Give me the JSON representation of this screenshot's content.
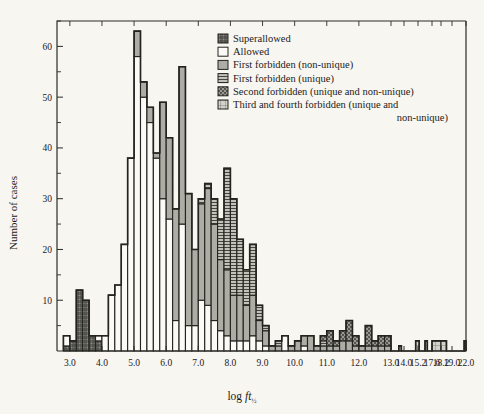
{
  "figure": {
    "background_color": "#f8f6f1",
    "frame_color": "#23231f"
  },
  "legend": {
    "position": "top-right-inside",
    "items": [
      {
        "label": "Superallowed",
        "pattern": "cross-hatch-dark",
        "color": "#6f6f68"
      },
      {
        "label": "Allowed",
        "pattern": "empty",
        "color": "#ffffff"
      },
      {
        "label": "First forbidden (non-unique)",
        "pattern": "solid-gray",
        "color": "#a9a9a2"
      },
      {
        "label": "First forbidden (unique)",
        "pattern": "horizontal-lines",
        "color": "#b6b6ae"
      },
      {
        "label": "Second forbidden (unique and non-unique)",
        "pattern": "checker-dark",
        "color": "#8a8a82"
      },
      {
        "label": "Third and fourth forbidden (unique and",
        "pattern": "light-grid",
        "color": "#cfcfc7"
      },
      {
        "label": "non-unique)",
        "pattern": "continuation",
        "color": ""
      }
    ]
  },
  "chart_data": {
    "type": "bar",
    "subtype": "stacked-histogram",
    "title": "",
    "xlabel": "log ft½",
    "ylabel": "Number of cases",
    "xlim": [
      2.6,
      22.6
    ],
    "ylim": [
      0,
      65
    ],
    "grid": false,
    "bin_width": 0.2,
    "y_ticks_major": [
      10,
      20,
      30,
      40,
      50,
      60
    ],
    "y_ticks_minor": [
      5,
      15,
      25,
      35,
      45,
      55,
      65
    ],
    "x_tick_labels": [
      "3.0",
      "4.0",
      "5.0",
      "6.0",
      "7.0",
      "8.0",
      "9.0",
      "10.0",
      "11.0",
      "12.0",
      "13.0",
      "14.0",
      "15.2",
      "17.6",
      "18.2",
      "19.0",
      "22.0"
    ],
    "x_tick_values": [
      3.0,
      4.0,
      5.0,
      6.0,
      7.0,
      8.0,
      9.0,
      10.0,
      11.0,
      12.0,
      13.0,
      14.0,
      15.2,
      17.6,
      18.2,
      19.0,
      22.0
    ],
    "x_axis_note": "linear from 3.0 to 13.0, compressed beyond 13.0",
    "series": [
      {
        "name": "Superallowed",
        "pattern": "cross-hatch-dark"
      },
      {
        "name": "Allowed",
        "pattern": "empty"
      },
      {
        "name": "First forbidden (non-unique)",
        "pattern": "solid-gray"
      },
      {
        "name": "First forbidden (unique)",
        "pattern": "horizontal-lines"
      },
      {
        "name": "Second forbidden (unique and non-unique)",
        "pattern": "checker-dark"
      },
      {
        "name": "Third and fourth forbidden (unique and non-unique)",
        "pattern": "light-grid"
      }
    ],
    "bins": [
      {
        "x0": 2.8,
        "x1": 3.0,
        "superallowed": 1,
        "allowed": 2,
        "ff_nonunique": 0,
        "ff_unique": 0,
        "second": 0,
        "third_fourth": 0
      },
      {
        "x0": 3.0,
        "x1": 3.2,
        "superallowed": 2,
        "allowed": 0,
        "ff_nonunique": 0,
        "ff_unique": 0,
        "second": 0,
        "third_fourth": 0
      },
      {
        "x0": 3.2,
        "x1": 3.4,
        "superallowed": 12,
        "allowed": 0,
        "ff_nonunique": 0,
        "ff_unique": 0,
        "second": 0,
        "third_fourth": 0
      },
      {
        "x0": 3.4,
        "x1": 3.6,
        "superallowed": 10,
        "allowed": 0,
        "ff_nonunique": 0,
        "ff_unique": 0,
        "second": 0,
        "third_fourth": 0
      },
      {
        "x0": 3.6,
        "x1": 3.8,
        "superallowed": 3,
        "allowed": 0,
        "ff_nonunique": 0,
        "ff_unique": 0,
        "second": 0,
        "third_fourth": 0
      },
      {
        "x0": 3.8,
        "x1": 4.0,
        "superallowed": 2,
        "allowed": 1,
        "ff_nonunique": 0,
        "ff_unique": 0,
        "second": 0,
        "third_fourth": 0
      },
      {
        "x0": 4.0,
        "x1": 4.2,
        "superallowed": 0,
        "allowed": 3,
        "ff_nonunique": 0,
        "ff_unique": 0,
        "second": 0,
        "third_fourth": 0
      },
      {
        "x0": 4.2,
        "x1": 4.4,
        "superallowed": 0,
        "allowed": 11,
        "ff_nonunique": 0,
        "ff_unique": 0,
        "second": 0,
        "third_fourth": 0
      },
      {
        "x0": 4.4,
        "x1": 4.6,
        "superallowed": 0,
        "allowed": 13,
        "ff_nonunique": 0,
        "ff_unique": 0,
        "second": 0,
        "third_fourth": 0
      },
      {
        "x0": 4.6,
        "x1": 4.8,
        "superallowed": 0,
        "allowed": 21,
        "ff_nonunique": 0,
        "ff_unique": 0,
        "second": 0,
        "third_fourth": 0
      },
      {
        "x0": 4.8,
        "x1": 5.0,
        "superallowed": 0,
        "allowed": 38,
        "ff_nonunique": 0,
        "ff_unique": 0,
        "second": 0,
        "third_fourth": 0
      },
      {
        "x0": 5.0,
        "x1": 5.2,
        "superallowed": 0,
        "allowed": 58,
        "ff_nonunique": 5,
        "ff_unique": 0,
        "second": 0,
        "third_fourth": 0
      },
      {
        "x0": 5.2,
        "x1": 5.4,
        "superallowed": 0,
        "allowed": 50,
        "ff_nonunique": 3,
        "ff_unique": 0,
        "second": 0,
        "third_fourth": 0
      },
      {
        "x0": 5.4,
        "x1": 5.6,
        "superallowed": 0,
        "allowed": 45,
        "ff_nonunique": 3,
        "ff_unique": 0,
        "second": 0,
        "third_fourth": 0
      },
      {
        "x0": 5.6,
        "x1": 5.8,
        "superallowed": 0,
        "allowed": 38,
        "ff_nonunique": 1,
        "ff_unique": 0,
        "second": 0,
        "third_fourth": 0
      },
      {
        "x0": 5.8,
        "x1": 6.0,
        "superallowed": 0,
        "allowed": 30,
        "ff_nonunique": 19,
        "ff_unique": 0,
        "second": 0,
        "third_fourth": 0
      },
      {
        "x0": 6.0,
        "x1": 6.2,
        "superallowed": 0,
        "allowed": 26,
        "ff_nonunique": 16,
        "ff_unique": 0,
        "second": 0,
        "third_fourth": 0
      },
      {
        "x0": 6.2,
        "x1": 6.4,
        "superallowed": 0,
        "allowed": 6,
        "ff_nonunique": 22,
        "ff_unique": 0,
        "second": 0,
        "third_fourth": 0
      },
      {
        "x0": 6.4,
        "x1": 6.6,
        "superallowed": 0,
        "allowed": 25,
        "ff_nonunique": 31,
        "ff_unique": 0,
        "second": 0,
        "third_fourth": 0
      },
      {
        "x0": 6.6,
        "x1": 6.8,
        "superallowed": 0,
        "allowed": 5,
        "ff_nonunique": 26,
        "ff_unique": 0,
        "second": 0,
        "third_fourth": 0
      },
      {
        "x0": 6.8,
        "x1": 7.0,
        "superallowed": 0,
        "allowed": 5,
        "ff_nonunique": 15,
        "ff_unique": 0,
        "second": 0,
        "third_fourth": 0
      },
      {
        "x0": 7.0,
        "x1": 7.2,
        "superallowed": 0,
        "allowed": 10,
        "ff_nonunique": 19,
        "ff_unique": 1,
        "second": 0,
        "third_fourth": 0
      },
      {
        "x0": 7.2,
        "x1": 7.4,
        "superallowed": 0,
        "allowed": 9,
        "ff_nonunique": 23,
        "ff_unique": 1,
        "second": 0,
        "third_fourth": 0
      },
      {
        "x0": 7.4,
        "x1": 7.6,
        "superallowed": 0,
        "allowed": 6,
        "ff_nonunique": 19,
        "ff_unique": 5,
        "second": 0,
        "third_fourth": 0
      },
      {
        "x0": 7.6,
        "x1": 7.8,
        "superallowed": 0,
        "allowed": 4,
        "ff_nonunique": 14,
        "ff_unique": 8,
        "second": 0,
        "third_fourth": 0
      },
      {
        "x0": 7.8,
        "x1": 8.0,
        "superallowed": 0,
        "allowed": 3,
        "ff_nonunique": 13,
        "ff_unique": 20,
        "second": 0,
        "third_fourth": 0
      },
      {
        "x0": 8.0,
        "x1": 8.2,
        "superallowed": 0,
        "allowed": 2,
        "ff_nonunique": 9,
        "ff_unique": 19,
        "second": 0,
        "third_fourth": 0
      },
      {
        "x0": 8.2,
        "x1": 8.4,
        "superallowed": 0,
        "allowed": 2,
        "ff_nonunique": 9,
        "ff_unique": 11,
        "second": 0,
        "third_fourth": 0
      },
      {
        "x0": 8.4,
        "x1": 8.6,
        "superallowed": 0,
        "allowed": 2,
        "ff_nonunique": 7,
        "ff_unique": 7,
        "second": 0,
        "third_fourth": 0
      },
      {
        "x0": 8.6,
        "x1": 8.8,
        "superallowed": 0,
        "allowed": 3,
        "ff_nonunique": 8,
        "ff_unique": 10,
        "second": 0,
        "third_fourth": 0
      },
      {
        "x0": 8.8,
        "x1": 9.0,
        "superallowed": 0,
        "allowed": 2,
        "ff_nonunique": 4,
        "ff_unique": 3,
        "second": 0,
        "third_fourth": 0
      },
      {
        "x0": 9.0,
        "x1": 9.2,
        "superallowed": 0,
        "allowed": 1,
        "ff_nonunique": 3,
        "ff_unique": 1,
        "second": 0,
        "third_fourth": 0
      },
      {
        "x0": 9.2,
        "x1": 9.4,
        "superallowed": 0,
        "allowed": 0,
        "ff_nonunique": 1,
        "ff_unique": 0,
        "second": 0,
        "third_fourth": 0
      },
      {
        "x0": 9.4,
        "x1": 9.6,
        "superallowed": 0,
        "allowed": 0,
        "ff_nonunique": 1,
        "ff_unique": 1,
        "second": 0,
        "third_fourth": 0
      },
      {
        "x0": 9.6,
        "x1": 9.8,
        "superallowed": 0,
        "allowed": 3,
        "ff_nonunique": 0,
        "ff_unique": 0,
        "second": 0,
        "third_fourth": 0
      },
      {
        "x0": 9.8,
        "x1": 10.0,
        "superallowed": 0,
        "allowed": 0,
        "ff_nonunique": 1,
        "ff_unique": 0,
        "second": 0,
        "third_fourth": 0
      },
      {
        "x0": 10.0,
        "x1": 10.2,
        "superallowed": 0,
        "allowed": 0,
        "ff_nonunique": 2,
        "ff_unique": 0,
        "second": 0,
        "third_fourth": 0
      },
      {
        "x0": 10.2,
        "x1": 10.4,
        "superallowed": 0,
        "allowed": 1,
        "ff_nonunique": 2,
        "ff_unique": 0,
        "second": 0,
        "third_fourth": 0
      },
      {
        "x0": 10.4,
        "x1": 10.6,
        "superallowed": 0,
        "allowed": 0,
        "ff_nonunique": 3,
        "ff_unique": 0,
        "second": 0,
        "third_fourth": 0
      },
      {
        "x0": 10.6,
        "x1": 10.8,
        "superallowed": 0,
        "allowed": 0,
        "ff_nonunique": 1,
        "ff_unique": 0,
        "second": 0,
        "third_fourth": 0
      },
      {
        "x0": 10.8,
        "x1": 11.0,
        "superallowed": 0,
        "allowed": 0,
        "ff_nonunique": 1,
        "ff_unique": 1,
        "second": 1,
        "third_fourth": 0
      },
      {
        "x0": 11.0,
        "x1": 11.2,
        "superallowed": 0,
        "allowed": 0,
        "ff_nonunique": 1,
        "ff_unique": 0,
        "second": 3,
        "third_fourth": 0
      },
      {
        "x0": 11.2,
        "x1": 11.4,
        "superallowed": 0,
        "allowed": 0,
        "ff_nonunique": 1,
        "ff_unique": 0,
        "second": 1,
        "third_fourth": 0
      },
      {
        "x0": 11.4,
        "x1": 11.6,
        "superallowed": 0,
        "allowed": 0,
        "ff_nonunique": 2,
        "ff_unique": 0,
        "second": 2,
        "third_fourth": 0
      },
      {
        "x0": 11.6,
        "x1": 11.8,
        "superallowed": 0,
        "allowed": 0,
        "ff_nonunique": 2,
        "ff_unique": 0,
        "second": 4,
        "third_fourth": 0
      },
      {
        "x0": 11.8,
        "x1": 12.0,
        "superallowed": 0,
        "allowed": 0,
        "ff_nonunique": 1,
        "ff_unique": 0,
        "second": 2,
        "third_fourth": 0
      },
      {
        "x0": 12.0,
        "x1": 12.2,
        "superallowed": 0,
        "allowed": 0,
        "ff_nonunique": 1,
        "ff_unique": 0,
        "second": 0,
        "third_fourth": 0
      },
      {
        "x0": 12.2,
        "x1": 12.4,
        "superallowed": 0,
        "allowed": 0,
        "ff_nonunique": 1,
        "ff_unique": 0,
        "second": 4,
        "third_fourth": 0
      },
      {
        "x0": 12.4,
        "x1": 12.6,
        "superallowed": 0,
        "allowed": 0,
        "ff_nonunique": 1,
        "ff_unique": 0,
        "second": 1,
        "third_fourth": 0
      },
      {
        "x0": 12.6,
        "x1": 12.8,
        "superallowed": 0,
        "allowed": 0,
        "ff_nonunique": 1,
        "ff_unique": 0,
        "second": 2,
        "third_fourth": 0
      },
      {
        "x0": 12.8,
        "x1": 13.0,
        "superallowed": 0,
        "allowed": 0,
        "ff_nonunique": 1,
        "ff_unique": 0,
        "second": 2,
        "third_fourth": 0
      },
      {
        "x0": 13.6,
        "x1": 13.8,
        "superallowed": 0,
        "allowed": 0,
        "ff_nonunique": 0,
        "ff_unique": 0,
        "second": 0,
        "third_fourth": 1
      },
      {
        "x0": 15.0,
        "x1": 15.4,
        "superallowed": 0,
        "allowed": 0,
        "ff_nonunique": 0,
        "ff_unique": 0,
        "second": 0,
        "third_fourth": 2
      },
      {
        "x0": 16.4,
        "x1": 16.8,
        "superallowed": 0,
        "allowed": 0,
        "ff_nonunique": 0,
        "ff_unique": 0,
        "second": 0,
        "third_fourth": 2
      },
      {
        "x0": 17.6,
        "x1": 18.2,
        "superallowed": 0,
        "allowed": 0,
        "ff_nonunique": 0,
        "ff_unique": 0,
        "second": 0,
        "third_fourth": 2
      },
      {
        "x0": 18.2,
        "x1": 18.6,
        "superallowed": 0,
        "allowed": 0,
        "ff_nonunique": 0,
        "ff_unique": 0,
        "second": 0,
        "third_fourth": 2
      },
      {
        "x0": 21.6,
        "x1": 22.2,
        "superallowed": 0,
        "allowed": 0,
        "ff_nonunique": 0,
        "ff_unique": 0,
        "second": 0,
        "third_fourth": 2
      }
    ]
  }
}
